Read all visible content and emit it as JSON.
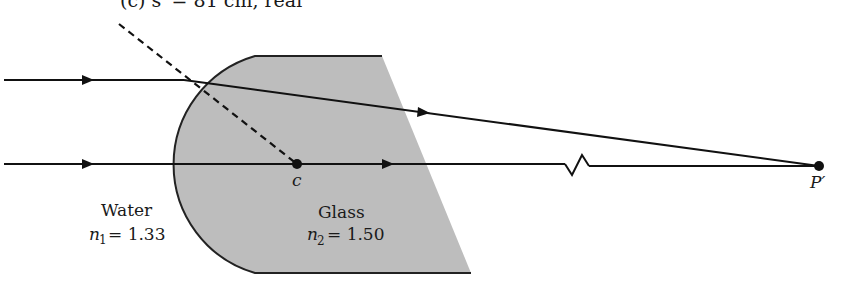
{
  "caption": {
    "text": "(c) s′ = 81 cm, real",
    "clipped": true
  },
  "labels": {
    "center": "c",
    "image_point": "P′",
    "water_name": "Water",
    "water_index_symbol": "n",
    "water_index_sub": "1",
    "water_index_value": "= 1.33",
    "glass_name": "Glass",
    "glass_index_symbol": "n",
    "glass_index_sub": "2",
    "glass_index_value": "= 1.50"
  },
  "colors": {
    "glass_fill": "#bdbdbd",
    "stroke": "#111111",
    "background": "#ffffff"
  },
  "geometry": {
    "center_c": [
      297,
      164
    ],
    "image_point_p": [
      819,
      166
    ],
    "upper_ray_y": 80,
    "axis_y": 164,
    "refraction_point": [
      184,
      80
    ]
  }
}
